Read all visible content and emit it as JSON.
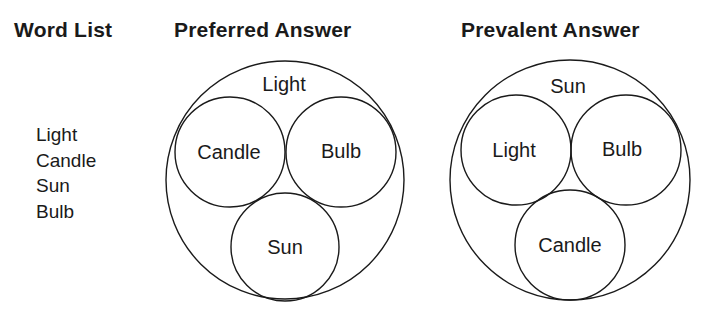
{
  "headers": {
    "word_list": "Word List",
    "preferred": "Preferred Answer",
    "prevalent": "Prevalent Answer"
  },
  "word_list": [
    "Light",
    "Candle",
    "Sun",
    "Bulb"
  ],
  "preferred": {
    "outer": "Light",
    "inner": [
      "Candle",
      "Bulb",
      "Sun"
    ]
  },
  "prevalent": {
    "outer": "Sun",
    "inner": [
      "Light",
      "Bulb",
      "Candle"
    ]
  },
  "colors": {
    "stroke": "#1a1a1a",
    "background": "#ffffff"
  }
}
